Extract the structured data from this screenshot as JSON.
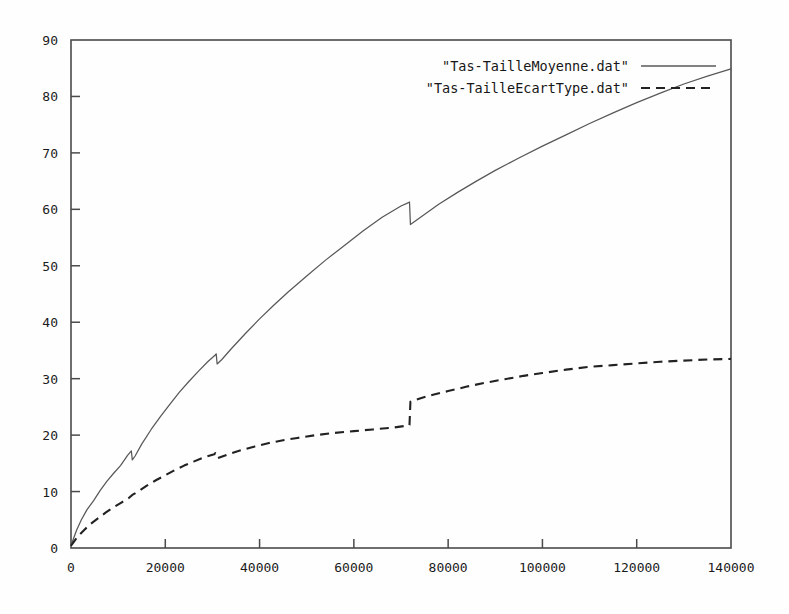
{
  "chart_data": {
    "type": "line",
    "title": "",
    "xlabel": "",
    "ylabel": "",
    "xlim": [
      0,
      140000
    ],
    "ylim": [
      0,
      90
    ],
    "grid": false,
    "legend_position": "top-right",
    "xticks": [
      "0",
      "20000",
      "40000",
      "60000",
      "80000",
      "100000",
      "120000",
      "140000"
    ],
    "xtick_values": [
      0,
      20000,
      40000,
      60000,
      80000,
      100000,
      120000,
      140000
    ],
    "yticks": [
      "0",
      "10",
      "20",
      "30",
      "40",
      "50",
      "60",
      "70",
      "80",
      "90"
    ],
    "ytick_values": [
      0,
      10,
      20,
      30,
      40,
      50,
      60,
      70,
      80,
      90
    ],
    "series": [
      {
        "name": "\"Tas-TailleMoyenne.dat\"",
        "style": "solid",
        "color": "#585858",
        "x": [
          0,
          500,
          1200,
          2200,
          3400,
          4800,
          6200,
          7600,
          9000,
          10500,
          12000,
          12800,
          13000,
          13600,
          15000,
          17000,
          19000,
          21000,
          23000,
          25000,
          27000,
          29000,
          30600,
          30800,
          31000,
          32000,
          34000,
          37000,
          40000,
          43000,
          46000,
          50000,
          54000,
          58000,
          62000,
          66000,
          70000,
          71600,
          71800,
          72000,
          74000,
          78000,
          82000,
          86000,
          90000,
          95000,
          100000,
          105000,
          110000,
          115000,
          120000,
          125000,
          130000,
          135000,
          140000
        ],
        "y": [
          0.5,
          1.6,
          3.2,
          5.0,
          6.8,
          8.4,
          10.2,
          11.8,
          13.2,
          14.6,
          16.4,
          17.2,
          15.6,
          16.3,
          18.4,
          21.0,
          23.3,
          25.5,
          27.6,
          29.5,
          31.3,
          33.0,
          34.2,
          34.4,
          32.6,
          33.4,
          35.3,
          38.0,
          40.6,
          43.0,
          45.3,
          48.2,
          51.0,
          53.6,
          56.2,
          58.6,
          60.6,
          61.2,
          61.3,
          57.3,
          58.5,
          60.9,
          63.0,
          65.0,
          66.9,
          69.1,
          71.2,
          73.2,
          75.2,
          77.1,
          78.9,
          80.6,
          82.2,
          83.6,
          84.9
        ]
      },
      {
        "name": "\"Tas-TailleEcartType.dat\"",
        "style": "dashed",
        "color": "#222222",
        "x": [
          0,
          600,
          1500,
          2800,
          4200,
          5800,
          7400,
          9000,
          10600,
          12200,
          13000,
          14000,
          16000,
          18000,
          20000,
          22000,
          24000,
          26000,
          28000,
          30400,
          30600,
          31000,
          33000,
          36000,
          39000,
          42000,
          45000,
          48000,
          52000,
          56000,
          60000,
          64000,
          68000,
          71600,
          71800,
          72000,
          74000,
          77000,
          80000,
          84000,
          88000,
          92000,
          96000,
          100000,
          105000,
          110000,
          115000,
          120000,
          125000,
          130000,
          135000,
          140000
        ],
        "y": [
          0.4,
          1.1,
          2.1,
          3.2,
          4.3,
          5.3,
          6.3,
          7.2,
          8.0,
          8.8,
          9.4,
          9.9,
          11.0,
          12.0,
          12.9,
          13.8,
          14.6,
          15.3,
          16.0,
          16.6,
          16.8,
          15.9,
          16.5,
          17.3,
          18.0,
          18.6,
          19.1,
          19.5,
          20.0,
          20.4,
          20.7,
          21.0,
          21.3,
          21.7,
          21.8,
          25.9,
          26.5,
          27.2,
          27.8,
          28.6,
          29.3,
          29.9,
          30.5,
          31.0,
          31.6,
          32.1,
          32.4,
          32.7,
          33.0,
          33.2,
          33.4,
          33.5
        ]
      }
    ],
    "annotations": [
      {
        "label": "drop-in-mean-at-72000",
        "x": 72000,
        "from_y": 61.3,
        "to_y": 57.3
      },
      {
        "label": "jump-in-stddev-at-72000",
        "x": 72000,
        "from_y": 21.8,
        "to_y": 25.9
      },
      {
        "label": "small-dip-in-mean-at-31000",
        "x": 31000,
        "from_y": 34.4,
        "to_y": 32.6
      },
      {
        "label": "small-dip-in-mean-at-13000",
        "x": 13000,
        "from_y": 17.2,
        "to_y": 15.6
      }
    ]
  },
  "legend": {
    "entries": [
      {
        "label": "\"Tas-TailleMoyenne.dat\"",
        "sample": "solid-line-sample"
      },
      {
        "label": "\"Tas-TailleEcartType.dat\"",
        "sample": "dashed-line-sample"
      }
    ]
  },
  "colors": {
    "background": "#fefefe",
    "frame": "#4a4a4a",
    "series_solid": "#585858",
    "series_dashed": "#222222",
    "text": "#1b1b1b"
  }
}
